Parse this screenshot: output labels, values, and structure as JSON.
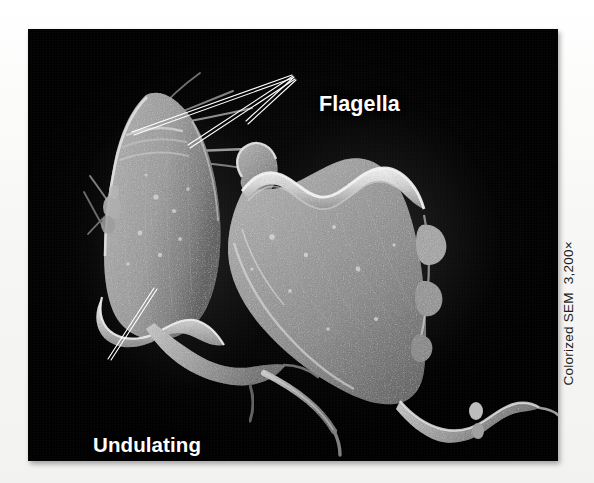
{
  "figure": {
    "kind": "colorized-scanning-electron-micrograph",
    "background_color": "#f8f8f6",
    "panel_color": "#000000",
    "specimen_color": "#9b9b9b"
  },
  "panel": {
    "x": 28,
    "y": 29,
    "width": 530,
    "height": 432
  },
  "annotations": {
    "flagella": {
      "label": "Flagella",
      "color": "#ffffff",
      "leader_count": 3
    },
    "undulating_membrane": {
      "line1": "Undulating",
      "line2": "membrane",
      "color": "#ffffff",
      "leader_count": 1
    }
  },
  "credit": {
    "text": "Colorized SEM  3,200×",
    "technique": "Colorized SEM",
    "magnification": "3,200×",
    "orientation": "vertical-bottom-to-top",
    "color": "#1d1d1d"
  },
  "specimens": [
    {
      "name": "left-cell",
      "description": "upright teardrop-shaped flagellate with anterior flagella and posterior tail"
    },
    {
      "name": "right-cell",
      "description": "larger tilted flagellate with prominent wavy undulating membrane along its dorsal crest"
    }
  ]
}
